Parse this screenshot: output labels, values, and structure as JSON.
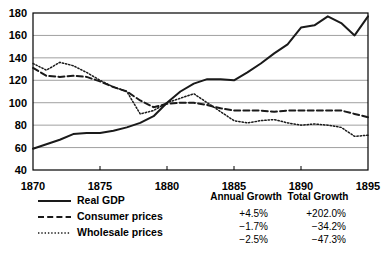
{
  "chart_data": {
    "type": "line",
    "title": "",
    "xlabel": "",
    "ylabel": "",
    "xlim": [
      1870,
      1895
    ],
    "ylim": [
      40,
      180
    ],
    "ytick_labels": [
      "180",
      "160",
      "140",
      "120",
      "100",
      "80",
      "60",
      "40"
    ],
    "yticks": [
      180,
      160,
      140,
      120,
      100,
      80,
      60,
      40
    ],
    "xtick_labels": [
      "1870",
      "1875",
      "1880",
      "1885",
      "1890",
      "1895"
    ],
    "xticks": [
      1870,
      1875,
      1880,
      1885,
      1890,
      1895
    ],
    "grid": true,
    "legend_position": "below-left",
    "x": [
      1870,
      1871,
      1872,
      1873,
      1874,
      1875,
      1876,
      1877,
      1878,
      1879,
      1880,
      1881,
      1882,
      1883,
      1884,
      1885,
      1886,
      1887,
      1888,
      1889,
      1890,
      1891,
      1892,
      1893,
      1894,
      1895
    ],
    "series": [
      {
        "name": "Real GDP",
        "style": "solid",
        "values": [
          59,
          63,
          67,
          72,
          73,
          73,
          75,
          78,
          82,
          88,
          100,
          110,
          117,
          121,
          121,
          120,
          127,
          135,
          144,
          152,
          167,
          169,
          177,
          171,
          160,
          177
        ]
      },
      {
        "name": "Consumer prices",
        "style": "dashed",
        "values": [
          131,
          124,
          123,
          124,
          123,
          119,
          114,
          110,
          102,
          96,
          99,
          100,
          100,
          98,
          95,
          93,
          93,
          93,
          92,
          93,
          93,
          93,
          93,
          93,
          90,
          87
        ]
      },
      {
        "name": "Wholesale prices",
        "style": "dotted",
        "values": [
          135,
          129,
          136,
          133,
          127,
          120,
          114,
          110,
          90,
          93,
          100,
          104,
          108,
          100,
          92,
          84,
          82,
          84,
          85,
          82,
          80,
          81,
          80,
          78,
          70,
          71
        ]
      }
    ]
  },
  "legend": {
    "items": [
      {
        "label": "Real GDP"
      },
      {
        "label": "Consumer prices"
      },
      {
        "label": "Wholesale prices"
      }
    ]
  },
  "stats": {
    "headers": [
      "Annual Growth",
      "Total Growth"
    ],
    "rows": [
      {
        "annual": "+4.5%",
        "total": "+202.0%"
      },
      {
        "annual": "−1.7%",
        "total": "−34.2%"
      },
      {
        "annual": "−2.5%",
        "total": "−47.3%"
      }
    ]
  }
}
